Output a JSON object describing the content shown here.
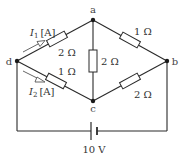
{
  "diagram": {
    "type": "bridge-circuit",
    "nodes": {
      "a": "a",
      "b": "b",
      "c": "c",
      "d": "d"
    },
    "resistors": {
      "da": "2 Ω",
      "ab": "1 Ω",
      "dc": "1 Ω",
      "cb": "2 Ω",
      "ac": "2 Ω"
    },
    "currents": {
      "i1_symbol": "I",
      "i1_sub": "1",
      "i1_unit": "[A]",
      "i2_symbol": "I",
      "i2_sub": "2",
      "i2_unit": "[A]"
    },
    "battery": {
      "voltage": "10 V"
    },
    "colors": {
      "wire": "#2a2a2a",
      "label": "#333333",
      "background": "#ffffff"
    }
  }
}
